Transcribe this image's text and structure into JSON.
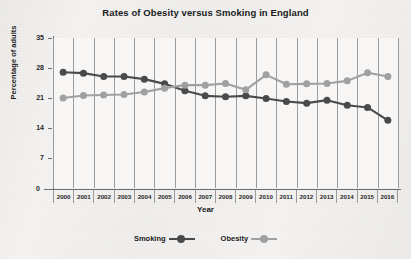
{
  "chart_data": {
    "type": "line",
    "title": "Rates of Obesity versus Smoking in England",
    "xlabel": "Year",
    "ylabel": "Percentage of adults",
    "categories": [
      "2000",
      "2001",
      "2002",
      "2003",
      "2004",
      "2005",
      "2006",
      "2007",
      "2008",
      "2009",
      "2010",
      "2011",
      "2012",
      "2013",
      "2014",
      "2015",
      "2016"
    ],
    "ylim": [
      0,
      35
    ],
    "yticks": [
      7,
      14,
      21,
      28,
      35
    ],
    "origin_label": "0",
    "grid": "vertical",
    "legend_position": "bottom",
    "series": [
      {
        "name": "Smoking",
        "color": "#4a4a4a",
        "values": [
          27.0,
          26.8,
          26.0,
          26.0,
          25.4,
          24.3,
          22.7,
          21.5,
          21.3,
          21.5,
          20.9,
          20.2,
          19.8,
          20.5,
          19.3,
          18.8,
          15.8
        ]
      },
      {
        "name": "Obesity",
        "color": "#a0a0a0",
        "values": [
          21.0,
          21.6,
          21.7,
          21.8,
          22.4,
          23.3,
          24.0,
          24.0,
          24.4,
          22.9,
          26.4,
          24.2,
          24.3,
          24.4,
          25.0,
          26.9,
          26.0
        ]
      }
    ]
  },
  "legend": {
    "items": [
      {
        "label": "Smoking"
      },
      {
        "label": "Obesity"
      }
    ]
  }
}
